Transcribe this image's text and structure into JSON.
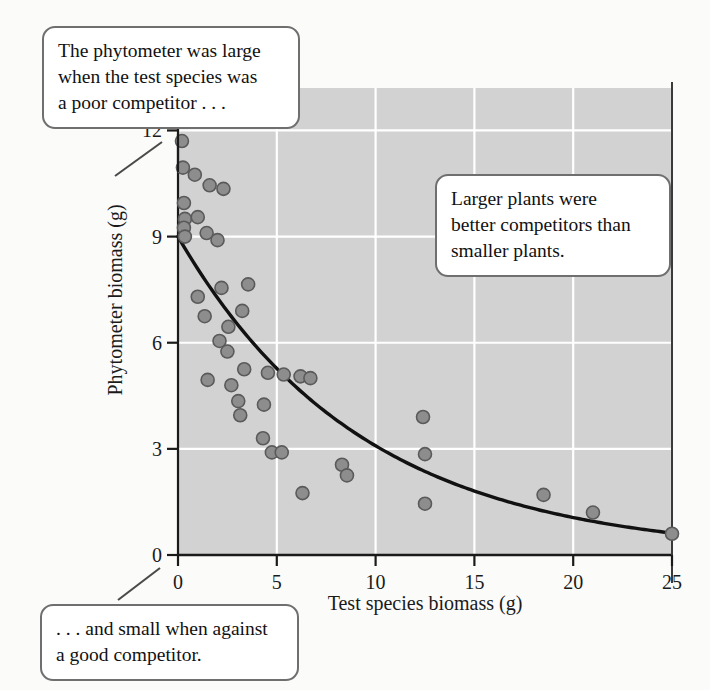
{
  "chart_data": {
    "type": "scatter",
    "title": "",
    "xlabel": "Test species biomass (g)",
    "ylabel": "Phytometer biomass (g)",
    "xlim": [
      0,
      25
    ],
    "ylim": [
      0,
      13.2
    ],
    "xticks": [
      0,
      5,
      10,
      15,
      20,
      25
    ],
    "yticks": [
      0,
      3,
      6,
      9,
      12
    ],
    "xtick_labels": [
      "0",
      "5",
      "10",
      "15",
      "20",
      "25"
    ],
    "ytick_labels": [
      "0",
      "3",
      "6",
      "9",
      "12"
    ],
    "grid": true,
    "grid_color": "#ffffff",
    "plot_background": "#d2d2d2",
    "legend": "none",
    "marker_color": "#8d8d8d",
    "marker_edge_color": "#5a5a5a",
    "marker_size_px": 13,
    "points": [
      [
        0.15,
        12.45
      ],
      [
        0.2,
        11.7
      ],
      [
        0.25,
        10.95
      ],
      [
        0.85,
        10.75
      ],
      [
        1.6,
        10.45
      ],
      [
        2.3,
        10.35
      ],
      [
        0.3,
        9.95
      ],
      [
        0.35,
        9.5
      ],
      [
        1.0,
        9.55
      ],
      [
        0.3,
        9.25
      ],
      [
        1.45,
        9.1
      ],
      [
        2.0,
        8.9
      ],
      [
        0.35,
        9.0
      ],
      [
        1.0,
        7.3
      ],
      [
        2.2,
        7.55
      ],
      [
        3.55,
        7.65
      ],
      [
        1.35,
        6.75
      ],
      [
        2.55,
        6.45
      ],
      [
        3.25,
        6.9
      ],
      [
        2.1,
        6.05
      ],
      [
        2.5,
        5.75
      ],
      [
        3.35,
        5.25
      ],
      [
        1.5,
        4.95
      ],
      [
        2.7,
        4.8
      ],
      [
        4.55,
        5.15
      ],
      [
        5.35,
        5.1
      ],
      [
        6.2,
        5.05
      ],
      [
        6.7,
        5.0
      ],
      [
        4.35,
        4.25
      ],
      [
        3.05,
        4.35
      ],
      [
        3.15,
        3.95
      ],
      [
        4.3,
        3.3
      ],
      [
        4.75,
        2.9
      ],
      [
        5.25,
        2.9
      ],
      [
        6.3,
        1.75
      ],
      [
        8.3,
        2.55
      ],
      [
        8.55,
        2.25
      ],
      [
        12.4,
        3.9
      ],
      [
        12.5,
        2.85
      ],
      [
        12.5,
        1.45
      ],
      [
        18.5,
        1.7
      ],
      [
        21.0,
        1.2
      ],
      [
        25.0,
        0.6
      ]
    ],
    "fit_curve": {
      "description": "fitted exponential decay through the scatter",
      "color": "#111111",
      "line_width_px": 3.4,
      "equation_form": "y = 9.0 * exp(-0.108 * x)",
      "start": [
        0,
        9.0
      ],
      "end": [
        25,
        0.62
      ]
    }
  },
  "annotations": {
    "top": {
      "lines": [
        "The phytometer was large",
        "when the test species was",
        "a poor competitor . . ."
      ]
    },
    "right": {
      "lines": [
        "Larger plants were",
        "better competitors than",
        "smaller plants."
      ]
    },
    "bottom": {
      "lines": [
        ". . . and small when against",
        "a good competitor."
      ]
    }
  }
}
